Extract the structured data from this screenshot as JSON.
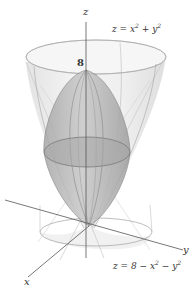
{
  "diagram": {
    "type": "3d-surface-plot",
    "axes": {
      "z_label": "z",
      "y_label": "y",
      "x_label": "x",
      "z_tick_label": "8"
    },
    "surfaces": [
      {
        "name": "upward-paraboloid",
        "equation_lhs": "z = x",
        "equation_exp1": "2",
        "equation_mid": " + y",
        "equation_exp2": "2",
        "equation_full": "z = x^2 + y^2"
      },
      {
        "name": "downward-paraboloid",
        "equation_lhs": "z = 8 − x",
        "equation_exp1": "2",
        "equation_mid": " − y",
        "equation_exp2": "2",
        "equation_full": "z = 8 - x^2 - y^2"
      }
    ],
    "colors": {
      "outer_surface_fill": "#ececec",
      "outer_surface_rim": "#f4f4f4",
      "inner_surface_fill": "#bdbdbd",
      "intersection_fill": "#a9a9a9",
      "mesh_line": "#8a8a8a",
      "axis_line": "#555555",
      "text": "#333333"
    }
  }
}
